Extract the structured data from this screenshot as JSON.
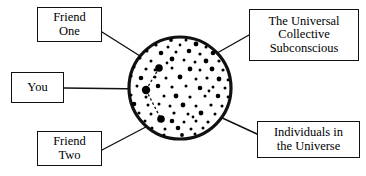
{
  "diagram": {
    "title": "The Universal Collective Subconscious",
    "type": "concept-diagram",
    "canvas": {
      "width": 366,
      "height": 176,
      "background": "#ffffff"
    },
    "colors": {
      "stroke": "#111111",
      "fill": "#ffffff",
      "dot": "#000000",
      "text": "#000000"
    },
    "circle": {
      "name": "universal-collective-subconscious-circle",
      "center_x": 180,
      "center_y": 88,
      "radius": 51,
      "stroke_width": 3.2
    },
    "labels": {
      "friend_one": "Friend\nOne",
      "you": "You",
      "friend_two": "Friend\nTwo",
      "universal": "The Universal\nCollective\nSubconscious",
      "individuals": "Individuals in\nthe Universe"
    },
    "markers": [
      {
        "name": "you-marker",
        "x": 146,
        "y": 90,
        "r": 4.2
      },
      {
        "name": "friend-one-marker",
        "x": 159,
        "y": 68,
        "r": 3.8
      },
      {
        "name": "friend-two-marker",
        "x": 161,
        "y": 119,
        "r": 3.8
      }
    ],
    "connections": [
      {
        "name": "you-to-friend-one",
        "x1": 146,
        "y1": 90,
        "x2": 159,
        "y2": 68,
        "style": "dashed"
      },
      {
        "name": "you-to-friend-two",
        "x1": 146,
        "y1": 90,
        "x2": 161,
        "y2": 119,
        "style": "dashed"
      }
    ],
    "leader_lines": [
      {
        "name": "leader-friend-one",
        "x1": 102,
        "y1": 32,
        "x2": 159,
        "y2": 68
      },
      {
        "name": "leader-you",
        "x1": 64,
        "y1": 88,
        "x2": 146,
        "y2": 89
      },
      {
        "name": "leader-friend-two",
        "x1": 102,
        "y1": 150,
        "x2": 161,
        "y2": 119
      },
      {
        "name": "leader-universal",
        "x1": 249,
        "y1": 35,
        "x2": 210,
        "y2": 57
      },
      {
        "name": "leader-individuals",
        "x1": 257,
        "y1": 134,
        "x2": 205,
        "y2": 110
      }
    ],
    "dots": [
      {
        "x": 171,
        "y": 40,
        "r": 1.9
      },
      {
        "x": 186,
        "y": 40,
        "r": 1.5
      },
      {
        "x": 156,
        "y": 45,
        "r": 1.6
      },
      {
        "x": 168,
        "y": 47,
        "r": 1.5
      },
      {
        "x": 180,
        "y": 45,
        "r": 1.4
      },
      {
        "x": 196,
        "y": 44,
        "r": 2.4
      },
      {
        "x": 206,
        "y": 47,
        "r": 1.5
      },
      {
        "x": 147,
        "y": 51,
        "r": 1.5
      },
      {
        "x": 161,
        "y": 53,
        "r": 2.3
      },
      {
        "x": 176,
        "y": 52,
        "r": 1.5
      },
      {
        "x": 189,
        "y": 51,
        "r": 2.3
      },
      {
        "x": 200,
        "y": 54,
        "r": 1.6
      },
      {
        "x": 213,
        "y": 53,
        "r": 2.3
      },
      {
        "x": 140,
        "y": 58,
        "r": 1.5
      },
      {
        "x": 151,
        "y": 61,
        "r": 1.5
      },
      {
        "x": 172,
        "y": 59,
        "r": 2.4
      },
      {
        "x": 184,
        "y": 60,
        "r": 1.5
      },
      {
        "x": 195,
        "y": 62,
        "r": 1.5
      },
      {
        "x": 206,
        "y": 61,
        "r": 2.4
      },
      {
        "x": 219,
        "y": 61,
        "r": 1.6
      },
      {
        "x": 134,
        "y": 67,
        "r": 1.5
      },
      {
        "x": 146,
        "y": 69,
        "r": 1.6
      },
      {
        "x": 172,
        "y": 68,
        "r": 1.5
      },
      {
        "x": 190,
        "y": 69,
        "r": 2.4
      },
      {
        "x": 200,
        "y": 70,
        "r": 1.5
      },
      {
        "x": 212,
        "y": 69,
        "r": 2.4
      },
      {
        "x": 223,
        "y": 70,
        "r": 1.6
      },
      {
        "x": 131,
        "y": 76,
        "r": 1.6
      },
      {
        "x": 141,
        "y": 78,
        "r": 2.3
      },
      {
        "x": 155,
        "y": 77,
        "r": 1.5
      },
      {
        "x": 166,
        "y": 78,
        "r": 1.5
      },
      {
        "x": 180,
        "y": 77,
        "r": 2.4
      },
      {
        "x": 196,
        "y": 79,
        "r": 1.5
      },
      {
        "x": 207,
        "y": 78,
        "r": 1.6
      },
      {
        "x": 219,
        "y": 79,
        "r": 2.4
      },
      {
        "x": 228,
        "y": 80,
        "r": 1.4
      },
      {
        "x": 137,
        "y": 86,
        "r": 1.5
      },
      {
        "x": 158,
        "y": 86,
        "r": 2.3
      },
      {
        "x": 172,
        "y": 87,
        "r": 1.6
      },
      {
        "x": 186,
        "y": 86,
        "r": 1.5
      },
      {
        "x": 200,
        "y": 88,
        "r": 2.3
      },
      {
        "x": 213,
        "y": 87,
        "r": 1.5
      },
      {
        "x": 225,
        "y": 88,
        "r": 1.5
      },
      {
        "x": 131,
        "y": 95,
        "r": 1.5
      },
      {
        "x": 146,
        "y": 97,
        "r": 1.5
      },
      {
        "x": 164,
        "y": 96,
        "r": 1.5
      },
      {
        "x": 176,
        "y": 96,
        "r": 2.4
      },
      {
        "x": 190,
        "y": 97,
        "r": 1.6
      },
      {
        "x": 205,
        "y": 96,
        "r": 1.5
      },
      {
        "x": 218,
        "y": 96,
        "r": 2.3
      },
      {
        "x": 228,
        "y": 97,
        "r": 1.4
      },
      {
        "x": 134,
        "y": 104,
        "r": 2.3
      },
      {
        "x": 148,
        "y": 105,
        "r": 1.5
      },
      {
        "x": 159,
        "y": 104,
        "r": 1.5
      },
      {
        "x": 170,
        "y": 106,
        "r": 1.5
      },
      {
        "x": 183,
        "y": 105,
        "r": 2.4
      },
      {
        "x": 196,
        "y": 106,
        "r": 1.5
      },
      {
        "x": 211,
        "y": 105,
        "r": 1.6
      },
      {
        "x": 222,
        "y": 106,
        "r": 1.5
      },
      {
        "x": 139,
        "y": 113,
        "r": 1.5
      },
      {
        "x": 151,
        "y": 114,
        "r": 1.5
      },
      {
        "x": 174,
        "y": 113,
        "r": 1.6
      },
      {
        "x": 188,
        "y": 114,
        "r": 1.5
      },
      {
        "x": 201,
        "y": 113,
        "r": 2.4
      },
      {
        "x": 215,
        "y": 114,
        "r": 1.5
      },
      {
        "x": 145,
        "y": 121,
        "r": 1.5
      },
      {
        "x": 172,
        "y": 121,
        "r": 2.3
      },
      {
        "x": 184,
        "y": 122,
        "r": 1.5
      },
      {
        "x": 196,
        "y": 121,
        "r": 1.5
      },
      {
        "x": 208,
        "y": 122,
        "r": 1.6
      },
      {
        "x": 152,
        "y": 128,
        "r": 1.5
      },
      {
        "x": 165,
        "y": 129,
        "r": 1.5
      },
      {
        "x": 178,
        "y": 128,
        "r": 2.3
      },
      {
        "x": 191,
        "y": 129,
        "r": 1.5
      },
      {
        "x": 203,
        "y": 128,
        "r": 1.5
      },
      {
        "x": 164,
        "y": 135,
        "r": 1.5
      },
      {
        "x": 182,
        "y": 135,
        "r": 1.9
      },
      {
        "x": 195,
        "y": 134,
        "r": 1.5
      },
      {
        "x": 155,
        "y": 70,
        "r": 1.4
      },
      {
        "x": 209,
        "y": 91,
        "r": 1.4
      },
      {
        "x": 167,
        "y": 63,
        "r": 1.4
      },
      {
        "x": 193,
        "y": 117,
        "r": 1.4
      }
    ]
  }
}
